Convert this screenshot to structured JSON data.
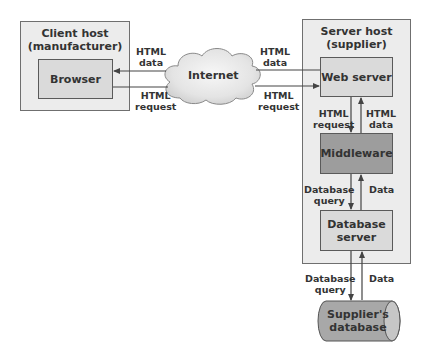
{
  "diagram": {
    "client_host": {
      "title_line1": "Client host",
      "title_line2": "(manufacturer)",
      "browser": "Browser"
    },
    "internet": {
      "label": "Internet"
    },
    "server_host": {
      "title_line1": "Server host",
      "title_line2": "(supplier)",
      "web_server": "Web server",
      "middleware": "Middleware",
      "database_server_line1": "Database",
      "database_server_line2": "server"
    },
    "database": {
      "line1": "Supplier's",
      "line2": "database"
    },
    "arrows": {
      "left_data": {
        "line1": "HTML",
        "line2": "data"
      },
      "left_request": {
        "line1": "HTML",
        "line2": "request"
      },
      "right_data": {
        "line1": "HTML",
        "line2": "data"
      },
      "right_request": {
        "line1": "HTML",
        "line2": "request"
      },
      "ws_mw_request": {
        "line1": "HTML",
        "line2": "request"
      },
      "mw_ws_data": {
        "line1": "HTML",
        "line2": "data"
      },
      "mw_db_query": {
        "line1": "Database",
        "line2": "query"
      },
      "db_mw_data": {
        "line1": "Data"
      },
      "dbs_store_query": {
        "line1": "Database",
        "line2": "query"
      },
      "store_dbs_data": {
        "line1": "Data"
      }
    },
    "colors": {
      "outer_box": "#ececec",
      "inner_box": "#dadada",
      "middleware": "#9d9d9d",
      "cylinder": "#a8a8a8",
      "cloud": "#e6e6e6"
    }
  }
}
